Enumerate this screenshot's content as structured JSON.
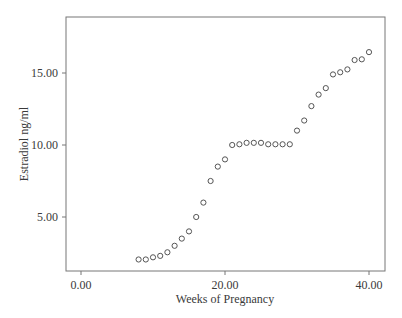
{
  "chart_data": {
    "type": "scatter",
    "title": "",
    "xlabel": "Weeks of Pregnancy",
    "ylabel": "Estradiol ng/ml",
    "xlim": [
      -2.2,
      42.3
    ],
    "ylim": [
      1.25,
      18.6
    ],
    "x_ticks": [
      0,
      20,
      40
    ],
    "x_tick_labels": [
      "0.00",
      "20.00",
      "40.00"
    ],
    "y_ticks": [
      5,
      10,
      15
    ],
    "y_tick_labels": [
      "5.00",
      "10.00",
      "15.00"
    ],
    "grid": false,
    "legend": null,
    "marker": "open-circle",
    "x": [
      8,
      9,
      10,
      11,
      12,
      13,
      14,
      15,
      16,
      17,
      18,
      19,
      20,
      21,
      22,
      23,
      24,
      25,
      26,
      27,
      28,
      29,
      30,
      31,
      32,
      33,
      34,
      35,
      36,
      37,
      38,
      39,
      40
    ],
    "y": [
      2.05,
      2.05,
      2.2,
      2.3,
      2.55,
      3.0,
      3.5,
      4.0,
      5.0,
      6.0,
      7.5,
      8.5,
      9.0,
      10.0,
      10.05,
      10.15,
      10.15,
      10.15,
      10.05,
      10.05,
      10.05,
      10.05,
      11.0,
      11.7,
      12.7,
      13.5,
      13.95,
      14.9,
      15.05,
      15.25,
      15.9,
      15.95,
      16.45
    ]
  },
  "colors": {
    "marker_stroke": "#555555",
    "axis": "#777777",
    "text": "#3a3a3a"
  }
}
